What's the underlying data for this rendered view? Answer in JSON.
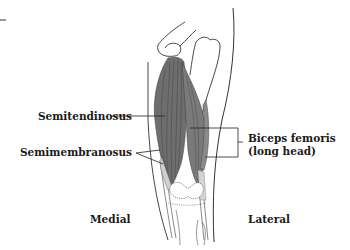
{
  "figure": {
    "type": "anatomical-illustration",
    "labels": {
      "semitendinosus": "Semitendinosus",
      "semimembranosus": "Semimembranosus",
      "biceps_femoris_line1": "Biceps femoris",
      "biceps_femoris_line2": "(long head)",
      "medial": "Medial",
      "lateral": "Lateral"
    },
    "colors": {
      "muscle": "#6e6e6e",
      "muscle_dark": "#4a4a4a",
      "tendon": "#c8c8c8",
      "bone_outline": "#333333",
      "text": "#1a1a1a",
      "background": "#ffffff"
    }
  }
}
